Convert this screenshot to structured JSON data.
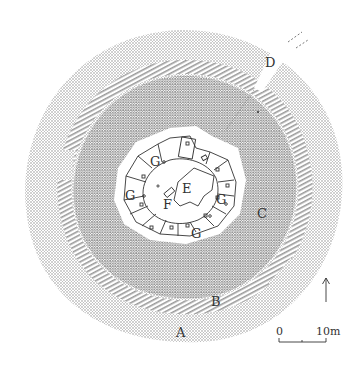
{
  "figure": {
    "type": "site-plan"
  },
  "labels": {
    "A": "A",
    "B": "B",
    "C": "C",
    "D": "D",
    "E": "E",
    "F": "F",
    "G1": "G",
    "G2": "G",
    "G3": "G",
    "G4": "G"
  },
  "scale_bar": {
    "start": "0",
    "end": "10m"
  },
  "north_arrow": {
    "icon": "north-arrow-icon"
  },
  "colors": {
    "stipple_outer": "#bdbdbd",
    "stipple_inner": "#9a9a9a",
    "hatch": "#8a8a8a",
    "line": "#333333",
    "background": "#ffffff"
  }
}
